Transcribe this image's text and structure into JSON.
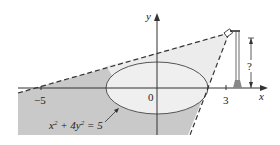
{
  "figure": {
    "axes": {
      "x_label": "x",
      "y_label": "y",
      "ticks": [
        {
          "label": "−5",
          "value": -5
        },
        {
          "label": "0",
          "value": 0
        },
        {
          "label": "3",
          "value": 3
        }
      ]
    },
    "ellipse": {
      "equation_lhs": "x",
      "equation_mid": " + 4y",
      "equation_rhs": " = 5",
      "sup1": "2",
      "sup2": "2",
      "center": [
        0,
        0
      ],
      "semi_axis_x": 2.236,
      "semi_axis_y": 1.118
    },
    "lamp": {
      "height_label": "?",
      "x_position": 3
    },
    "colors": {
      "dark_shade": "#c9c9c9",
      "light_shade": "#ececec",
      "ellipse_fill": "#efefef",
      "line": "#333333"
    }
  }
}
